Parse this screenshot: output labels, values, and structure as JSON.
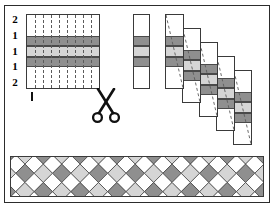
{
  "figure": {
    "title": "",
    "background": "#ffffff",
    "frame_color": "#2c2c2c"
  },
  "palette": {
    "dark_gray": "#8f8f8f",
    "light_gray": "#d5d5d5",
    "white": "#ffffff",
    "line": "#3a3a3a",
    "dash": "#5b5b5b",
    "ink": "#000000"
  },
  "row_labels": {
    "values": [
      "2",
      "1",
      "1",
      "1",
      "2"
    ],
    "tick_below_label": "1"
  },
  "cloth": {
    "name": "striped-cloth",
    "warp_column_count": 8,
    "bands": [
      {
        "label": "2",
        "fill": "#ffffff",
        "height_units": 2
      },
      {
        "label": "1",
        "fill": "#8f8f8f",
        "height_units": 1
      },
      {
        "label": "1",
        "fill": "#d5d5d5",
        "height_units": 1
      },
      {
        "label": "1",
        "fill": "#8f8f8f",
        "height_units": 1
      },
      {
        "label": "2",
        "fill": "#ffffff",
        "height_units": 2
      }
    ]
  },
  "cut_strip": {
    "name": "single-cut-strip",
    "bands": [
      "#ffffff",
      "#8f8f8f",
      "#d5d5d5",
      "#8f8f8f",
      "#ffffff"
    ],
    "band_units": [
      2,
      1,
      1,
      1,
      2
    ]
  },
  "staircase": {
    "name": "offset-strip-stack",
    "strip_count": 5,
    "offset_x": 17,
    "offset_y": 14,
    "bands": [
      "#ffffff",
      "#8f8f8f",
      "#d5d5d5",
      "#8f8f8f",
      "#ffffff"
    ],
    "band_units": [
      2,
      1,
      1,
      1,
      2
    ],
    "diagonal_style": "dashed"
  },
  "weave": {
    "name": "woven-lattice-result",
    "cell_size": 13,
    "colors": [
      "#8f8f8f",
      "#d5d5d5",
      "#ffffff"
    ],
    "orientation": "45-degree-diagonal-plaid"
  },
  "scissors": {
    "name": "scissors-icon",
    "color": "#111111"
  }
}
